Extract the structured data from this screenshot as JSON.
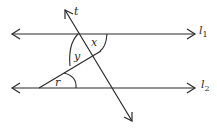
{
  "diagram": {
    "type": "geometry-parallel-lines-transversal",
    "colors": {
      "stroke": "#2a2a2a",
      "background": "#ffffff"
    },
    "lines": {
      "l1": {
        "label": "l",
        "subscript": "1"
      },
      "l2": {
        "label": "l",
        "subscript": "2"
      },
      "transversal": {
        "label": "t"
      }
    },
    "angles": {
      "x": "x",
      "y": "y",
      "r": "r"
    }
  }
}
